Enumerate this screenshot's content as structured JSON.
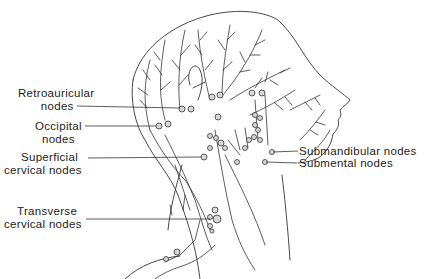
{
  "diagram": {
    "labels": {
      "retroauricular": {
        "line1": "Retroauricular",
        "line2": "nodes"
      },
      "occipital": {
        "line1": "Occipital",
        "line2": "nodes"
      },
      "superficial_cervical": {
        "line1": "Superficial",
        "line2": "cervical nodes"
      },
      "transverse_cervical": {
        "line1": "Transverse",
        "line2": "cervical nodes"
      },
      "submandibular": {
        "text": "Submandibular nodes"
      },
      "submental": {
        "text": "Submental nodes"
      }
    },
    "colors": {
      "line": "#333333",
      "node_fill": "#d8d8d8",
      "background": "#ffffff"
    }
  }
}
